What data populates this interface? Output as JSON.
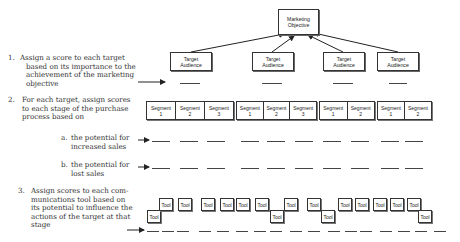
{
  "diagram": {
    "root": {
      "label_line1": "Marketing",
      "label_line2": "Objective"
    },
    "target_audiences": [
      {
        "line1": "Target",
        "line2": "Audience"
      },
      {
        "line1": "Target",
        "line2": "Audience"
      },
      {
        "line1": "Target",
        "line2": "Audience"
      },
      {
        "line1": "Target",
        "line2": "Audience"
      }
    ],
    "segment_groups": [
      [
        {
          "name": "Segment",
          "num": "1"
        },
        {
          "name": "Segment",
          "num": "2"
        },
        {
          "name": "Segment",
          "num": "3"
        }
      ],
      [
        {
          "name": "Segment",
          "num": "1"
        },
        {
          "name": "Segment",
          "num": "2"
        },
        {
          "name": "Segment",
          "num": "3"
        }
      ],
      [
        {
          "name": "Segment",
          "num": "1"
        },
        {
          "name": "Segment",
          "num": "2"
        }
      ],
      [
        {
          "name": "Segment",
          "num": "1"
        },
        {
          "name": "Segment",
          "num": "2"
        }
      ]
    ],
    "tool_label": "Tool",
    "tools": [
      "Tool",
      "Tool",
      "Tool",
      "Tool",
      "Tool",
      "Tool",
      "Tool",
      "Tool",
      "Tool",
      "Tool",
      "Tool",
      "Tool",
      "Tool",
      "Tool",
      "Tool",
      "Tool",
      "Tool",
      "Tool"
    ]
  },
  "steps": [
    {
      "number": "1.",
      "text": "Assign a score to each target based on its importance to the achievement of the marketing objective"
    },
    {
      "number": "2.",
      "text": "For each target, assign scores to each stage of the purchase process based on",
      "subitems": [
        {
          "letter": "a.",
          "text": "the potential for increased sales"
        },
        {
          "letter": "b.",
          "text": "the potential for lost sales"
        }
      ]
    },
    {
      "number": "3.",
      "text": "Assign scores to each communications tool based on its potential to influence the actions of the target at that stage"
    }
  ],
  "lines": {
    "step1": [
      "Assign a score to each target",
      "based on its importance to the",
      "achievement of the marketing",
      "objective"
    ],
    "step2": [
      "For each target, assign scores",
      "to each stage of the purchase",
      "process based on"
    ],
    "step2a": [
      "the potential for",
      "increased sales"
    ],
    "step2b": [
      "the potential for",
      "lost sales"
    ],
    "step3": [
      "Assign scores to each com-",
      "munications tool based on",
      "its potential to influence the",
      "actions of the target at that",
      "stage"
    ]
  }
}
